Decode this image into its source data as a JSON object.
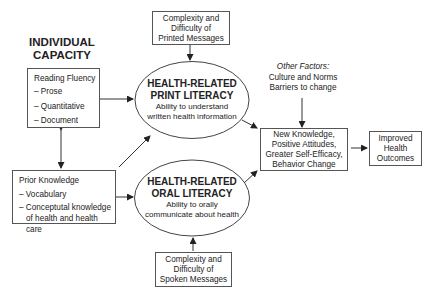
{
  "heading": {
    "line1": "INDIVIDUAL",
    "line2": "CAPACITY"
  },
  "reading_fluency": {
    "title": "Reading Fluency",
    "items": [
      "– Prose",
      "– Quantitative",
      "– Document"
    ]
  },
  "prior_knowledge": {
    "title": "Prior Knowledge",
    "items": [
      "– Vocabulary",
      "– Conceptutal knowledge",
      "of health and health care"
    ]
  },
  "printed_messages": {
    "lines": [
      "Complexity and",
      "Difficulty of",
      "Printed Messages"
    ]
  },
  "spoken_messages": {
    "lines": [
      "Complexity and",
      "Difficulty of",
      "Spoken Messages"
    ]
  },
  "print_literacy": {
    "title1": "HEALTH-RELATED",
    "title2": "PRINT LITERACY",
    "sub1": "Ability to understand",
    "sub2": "written health information"
  },
  "oral_literacy": {
    "title1": "HEALTH-RELATED",
    "title2": "ORAL LITERACY",
    "sub1": "Ability to orally",
    "sub2": "communicate about health"
  },
  "other_factors": {
    "label": "Other Factors:",
    "line1": "Culture and Norms",
    "line2": "Barriers to change"
  },
  "outcomes_intermediate": {
    "lines": [
      "New Knowledge,",
      "Positive Attitudes,",
      "Greater Self-Efficacy,",
      "Behavior Change"
    ]
  },
  "outcomes_final": {
    "lines": [
      "Improved",
      "Health",
      "Outcomes"
    ]
  },
  "colors": {
    "line": "#333333",
    "border": "#555555",
    "text": "#222222",
    "background": "#ffffff"
  }
}
